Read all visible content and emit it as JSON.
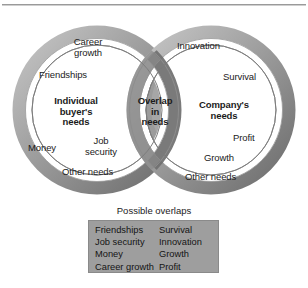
{
  "diagram": {
    "title_rule": "horizontal-divider",
    "left_circle": {
      "heading": "Individual\nbuyer's\nneeds",
      "heading_lines": [
        "Individual",
        "buyer's",
        "needs"
      ],
      "items": [
        {
          "label": "Career\ngrowth",
          "lines": [
            "Career",
            "growth"
          ]
        },
        {
          "label": "Friendships",
          "lines": [
            "Friendships"
          ]
        },
        {
          "label": "Money",
          "lines": [
            "Money"
          ]
        },
        {
          "label": "Job\nsecurity",
          "lines": [
            "Job",
            "security"
          ]
        },
        {
          "label": "Other needs",
          "lines": [
            "Other needs"
          ]
        }
      ]
    },
    "right_circle": {
      "heading": "Company's\nneeds",
      "heading_lines": [
        "Company's",
        "needs"
      ],
      "items": [
        {
          "label": "Innovation",
          "lines": [
            "Innovation"
          ]
        },
        {
          "label": "Survival",
          "lines": [
            "Survival"
          ]
        },
        {
          "label": "Profit",
          "lines": [
            "Profit"
          ]
        },
        {
          "label": "Growth",
          "lines": [
            "Growth"
          ]
        },
        {
          "label": "Other needs",
          "lines": [
            "Other needs"
          ]
        }
      ]
    },
    "overlap": {
      "heading_lines": [
        "Overlap",
        "in",
        "needs"
      ]
    },
    "legend": {
      "title": "Possible overlaps",
      "left_column": [
        "Friendships",
        "Job security",
        "Money",
        "Career growth"
      ],
      "right_column": [
        "Survival",
        "Innovation",
        "Growth",
        "Profit"
      ]
    },
    "colors": {
      "ring_light": "#b6b6b6",
      "ring_mid": "#8f8f8f",
      "ring_dark": "#6e6e6e",
      "overlap_fill": "#9a9a9a",
      "legend_fill": "#9e9e9e",
      "text": "#1b1b1b",
      "outline": "#7d7d7d",
      "background": "#ffffff"
    }
  }
}
